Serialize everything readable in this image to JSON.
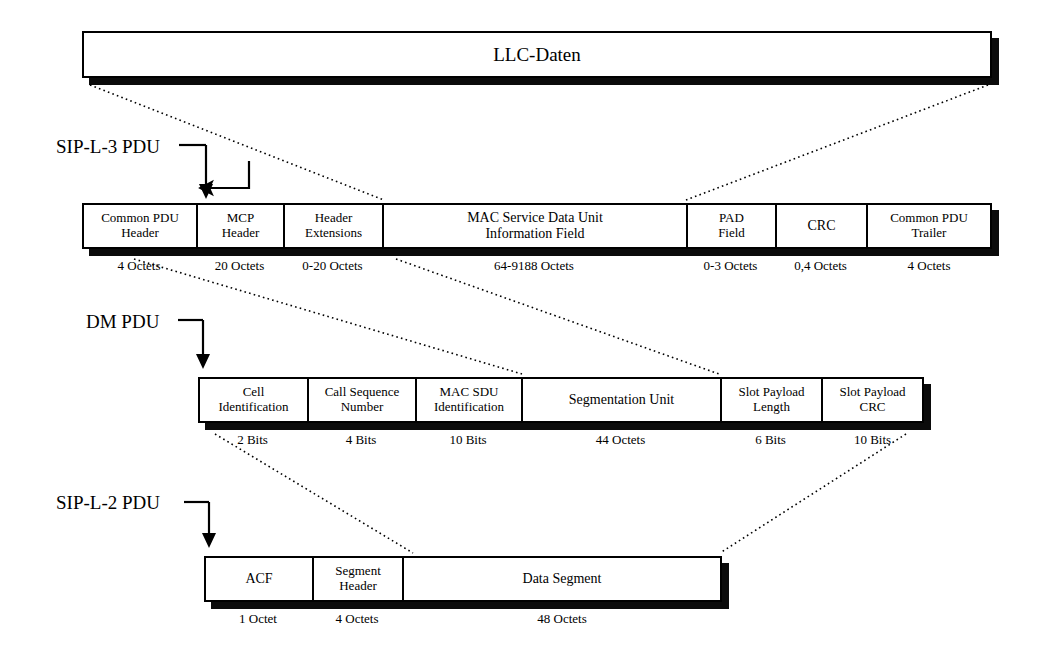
{
  "figure": {
    "ink_color": "#000000",
    "paper_color": "#ffffff",
    "shadow_color": "#0b0b0b"
  },
  "rows": [
    {
      "id": "llc",
      "label": "",
      "fields": [
        {
          "lines": [
            "LLC-Daten"
          ],
          "size": ""
        }
      ]
    },
    {
      "id": "sip_l3",
      "label": "SIP-L-3 PDU",
      "fields": [
        {
          "lines": [
            "Common PDU",
            "Header"
          ],
          "size": "4 Octets"
        },
        {
          "lines": [
            "MCP",
            "Header"
          ],
          "size": "20 Octets"
        },
        {
          "lines": [
            "Header",
            "Extensions"
          ],
          "size": "0-20 Octets"
        },
        {
          "lines": [
            "MAC Service Data Unit",
            "Information Field"
          ],
          "size": "64-9188 Octets"
        },
        {
          "lines": [
            "PAD",
            "Field"
          ],
          "size": "0-3 Octets"
        },
        {
          "lines": [
            "CRC"
          ],
          "size": "0,4 Octets"
        },
        {
          "lines": [
            "Common PDU",
            "Trailer"
          ],
          "size": "4 Octets"
        }
      ]
    },
    {
      "id": "dm_pdu",
      "label": "DM PDU",
      "fields": [
        {
          "lines": [
            "Cell",
            "Identification"
          ],
          "size": "2 Bits"
        },
        {
          "lines": [
            "Call Sequence",
            "Number"
          ],
          "size": "4 Bits"
        },
        {
          "lines": [
            "MAC SDU",
            "Identification"
          ],
          "size": "10 Bits"
        },
        {
          "lines": [
            "Segmentation Unit"
          ],
          "size": "44 Octets"
        },
        {
          "lines": [
            "Slot Payload",
            "Length"
          ],
          "size": "6 Bits"
        },
        {
          "lines": [
            "Slot Payload",
            "CRC"
          ],
          "size": "10 Bits"
        }
      ]
    },
    {
      "id": "sip_l2",
      "label": "SIP-L-2 PDU",
      "fields": [
        {
          "lines": [
            "ACF"
          ],
          "size": "1 Octet"
        },
        {
          "lines": [
            "Segment",
            "Header"
          ],
          "size": "4 Octets"
        },
        {
          "lines": [
            "Data Segment"
          ],
          "size": "48 Octets"
        }
      ]
    }
  ]
}
